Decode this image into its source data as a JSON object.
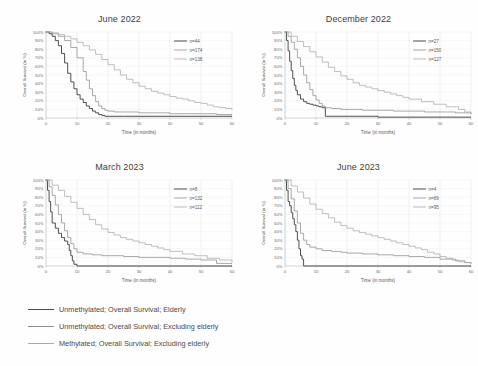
{
  "figure": {
    "background": "#ffffff",
    "series_colors": [
      "#4f4f4f",
      "#8e8e8e",
      "#a9a9a9"
    ]
  },
  "legend": {
    "entries": [
      {
        "label": "Unmethylated; Overall Survival; Elderly",
        "color": "#4f4f4f"
      },
      {
        "label": "Unmethylated; Overall Survival; Excluding elderly",
        "color": "#8e8e8e"
      },
      {
        "label": "Methylated; Overall Survival; Excluding elderly",
        "color": "#a9a9a9"
      }
    ]
  },
  "chart_data": [
    {
      "type": "line",
      "title": "June 2022",
      "xlabel": "Time (in months)",
      "ylabel": "Overall Survival (in %)",
      "xlim": [
        0,
        60
      ],
      "ylim": [
        0,
        100
      ],
      "xticks": [
        0,
        10,
        20,
        30,
        40,
        50,
        60
      ],
      "yticks": [
        0,
        10,
        20,
        30,
        40,
        50,
        60,
        70,
        80,
        90,
        100
      ],
      "ytick_labels": [
        "0%",
        "10%",
        "20%",
        "30%",
        "40%",
        "50%",
        "60%",
        "70%",
        "80%",
        "90%",
        "100%"
      ],
      "grid": true,
      "legend_position": "upper right",
      "series": [
        {
          "name": "n=44",
          "color": "#4f4f4f",
          "x": [
            0,
            1,
            2,
            3,
            4,
            5,
            6,
            7,
            8,
            9,
            10,
            11,
            12,
            13,
            14,
            15,
            16,
            17,
            18,
            19,
            20,
            25,
            30,
            40,
            50,
            60
          ],
          "y": [
            100,
            98,
            95,
            90,
            84,
            75,
            64,
            52,
            42,
            34,
            27,
            22,
            18,
            14,
            11,
            8,
            6,
            4,
            3,
            2,
            2,
            2,
            2,
            2,
            2,
            2
          ]
        },
        {
          "name": "n=174",
          "color": "#8e8e8e",
          "x": [
            0,
            2,
            4,
            6,
            8,
            10,
            12,
            13,
            14,
            15,
            16,
            17,
            18,
            19,
            20,
            22,
            25,
            30,
            35,
            40,
            45,
            50,
            55,
            60
          ],
          "y": [
            100,
            98,
            95,
            90,
            82,
            70,
            54,
            44,
            34,
            26,
            19,
            14,
            11,
            9,
            8,
            7,
            7,
            6,
            6,
            5,
            5,
            5,
            4,
            4
          ]
        },
        {
          "name": "n=138",
          "color": "#a9a9a9",
          "x": [
            0,
            2,
            4,
            6,
            8,
            10,
            12,
            14,
            16,
            18,
            20,
            22,
            24,
            26,
            28,
            30,
            32,
            34,
            36,
            38,
            40,
            42,
            44,
            46,
            48,
            50,
            52,
            54,
            56,
            58,
            60
          ],
          "y": [
            100,
            99,
            97,
            95,
            92,
            88,
            84,
            79,
            74,
            68,
            62,
            56,
            50,
            45,
            41,
            37,
            34,
            31,
            29,
            27,
            25,
            23,
            22,
            20,
            18,
            17,
            15,
            13,
            12,
            11,
            10
          ]
        }
      ]
    },
    {
      "type": "line",
      "title": "December 2022",
      "xlabel": "Time (in months)",
      "ylabel": "Overall Survival (in %)",
      "xlim": [
        0,
        60
      ],
      "ylim": [
        0,
        100
      ],
      "xticks": [
        0,
        10,
        20,
        30,
        40,
        50,
        60
      ],
      "yticks": [
        0,
        10,
        20,
        30,
        40,
        50,
        60,
        70,
        80,
        90,
        100
      ],
      "ytick_labels": [
        "0%",
        "10%",
        "20%",
        "30%",
        "40%",
        "50%",
        "60%",
        "70%",
        "80%",
        "90%",
        "100%"
      ],
      "grid": true,
      "legend_position": "upper right",
      "series": [
        {
          "name": "n=27",
          "color": "#4f4f4f",
          "x": [
            0,
            0.5,
            1,
            1.5,
            2,
            2.5,
            3,
            3.5,
            4,
            5,
            6,
            7,
            8,
            9,
            10,
            11,
            12,
            13,
            20,
            30,
            40,
            50,
            60
          ],
          "y": [
            100,
            90,
            78,
            66,
            55,
            46,
            38,
            32,
            27,
            22,
            19,
            17,
            16,
            15,
            14,
            13,
            12,
            2,
            2,
            1,
            1,
            1,
            1
          ]
        },
        {
          "name": "n=150",
          "color": "#8e8e8e",
          "x": [
            0,
            1,
            2,
            3,
            4,
            5,
            6,
            7,
            8,
            9,
            10,
            11,
            12,
            13,
            15,
            18,
            20,
            25,
            30,
            35,
            40,
            45,
            50,
            55,
            60
          ],
          "y": [
            100,
            95,
            88,
            80,
            70,
            60,
            50,
            41,
            33,
            26,
            21,
            17,
            14,
            12,
            11,
            10,
            10,
            9,
            9,
            8,
            8,
            7,
            7,
            6,
            5
          ]
        },
        {
          "name": "n=127",
          "color": "#a9a9a9",
          "x": [
            0,
            2,
            4,
            6,
            8,
            10,
            12,
            14,
            16,
            18,
            20,
            22,
            24,
            26,
            28,
            30,
            32,
            34,
            36,
            38,
            40,
            44,
            48,
            52,
            56,
            58,
            60
          ],
          "y": [
            100,
            95,
            89,
            83,
            77,
            71,
            65,
            59,
            54,
            49,
            45,
            41,
            38,
            36,
            34,
            32,
            30,
            28,
            26,
            24,
            22,
            19,
            16,
            13,
            10,
            7,
            5
          ]
        }
      ]
    },
    {
      "type": "line",
      "title": "March 2023",
      "xlabel": "Time (in months)",
      "ylabel": "Overall Survival (in %)",
      "xlim": [
        0,
        60
      ],
      "ylim": [
        0,
        100
      ],
      "xticks": [
        0,
        10,
        20,
        30,
        40,
        50,
        60
      ],
      "yticks": [
        0,
        10,
        20,
        30,
        40,
        50,
        60,
        70,
        80,
        90,
        100
      ],
      "ytick_labels": [
        "0%",
        "10%",
        "20%",
        "30%",
        "40%",
        "50%",
        "60%",
        "70%",
        "80%",
        "90%",
        "100%"
      ],
      "grid": true,
      "legend_position": "upper right",
      "series": [
        {
          "name": "n=8",
          "color": "#4f4f4f",
          "x": [
            0,
            0.5,
            1,
            1.5,
            2,
            3,
            4,
            5,
            6,
            7,
            7.5,
            8,
            8.5,
            9,
            10,
            20,
            30,
            40,
            50,
            60
          ],
          "y": [
            100,
            88,
            75,
            63,
            50,
            44,
            38,
            33,
            29,
            25,
            18,
            12,
            6,
            2,
            0,
            0,
            0,
            0,
            0,
            0
          ]
        },
        {
          "name": "n=132",
          "color": "#8e8e8e",
          "x": [
            0,
            1,
            2,
            3,
            4,
            5,
            6,
            7,
            8,
            9,
            10,
            12,
            15,
            18,
            20,
            25,
            30,
            35,
            40,
            45,
            50,
            53,
            55,
            58,
            60
          ],
          "y": [
            100,
            92,
            82,
            71,
            60,
            50,
            41,
            33,
            26,
            20,
            16,
            14,
            13,
            12,
            12,
            11,
            10,
            10,
            9,
            8,
            7,
            7,
            3,
            3,
            3
          ]
        },
        {
          "name": "n=112",
          "color": "#a9a9a9",
          "x": [
            0,
            2,
            4,
            6,
            8,
            10,
            12,
            14,
            16,
            18,
            20,
            22,
            24,
            26,
            28,
            30,
            32,
            34,
            36,
            38,
            40,
            44,
            48,
            52,
            56,
            60
          ],
          "y": [
            100,
            94,
            88,
            81,
            74,
            67,
            60,
            54,
            48,
            43,
            39,
            36,
            33,
            31,
            29,
            27,
            25,
            23,
            21,
            19,
            17,
            14,
            12,
            9,
            7,
            5
          ]
        }
      ]
    },
    {
      "type": "line",
      "title": "June 2023",
      "xlabel": "Time (in months)",
      "ylabel": "Overall Survival (in %)",
      "xlim": [
        0,
        60
      ],
      "ylim": [
        0,
        100
      ],
      "xticks": [
        0,
        10,
        20,
        30,
        40,
        50,
        60
      ],
      "yticks": [
        0,
        10,
        20,
        30,
        40,
        50,
        60,
        70,
        80,
        90,
        100
      ],
      "ytick_labels": [
        "0%",
        "10%",
        "20%",
        "30%",
        "40%",
        "50%",
        "60%",
        "70%",
        "80%",
        "90%",
        "100%"
      ],
      "grid": true,
      "legend_position": "upper right",
      "series": [
        {
          "name": "n=4",
          "color": "#4f4f4f",
          "x": [
            0,
            0.5,
            1,
            1.5,
            2,
            2.5,
            3,
            3.5,
            4,
            4.5,
            5,
            5.5,
            6,
            10,
            20,
            30,
            40,
            50,
            60
          ],
          "y": [
            100,
            88,
            75,
            70,
            62,
            55,
            48,
            40,
            30,
            20,
            12,
            8,
            0,
            0,
            0,
            0,
            0,
            0,
            0
          ]
        },
        {
          "name": "n=89",
          "color": "#8e8e8e",
          "x": [
            0,
            1,
            2,
            3,
            4,
            5,
            6,
            7,
            8,
            10,
            12,
            15,
            18,
            20,
            25,
            30,
            35,
            40,
            45,
            50,
            55,
            58,
            60
          ],
          "y": [
            100,
            90,
            78,
            64,
            50,
            38,
            30,
            25,
            22,
            20,
            18,
            17,
            16,
            15,
            14,
            13,
            12,
            11,
            10,
            8,
            6,
            4,
            3
          ]
        },
        {
          "name": "n=95",
          "color": "#a9a9a9",
          "x": [
            0,
            2,
            4,
            6,
            8,
            10,
            12,
            14,
            16,
            18,
            20,
            22,
            24,
            26,
            28,
            30,
            32,
            34,
            36,
            38,
            40,
            42,
            44,
            46,
            48,
            50,
            52,
            54,
            56,
            58,
            60
          ],
          "y": [
            100,
            93,
            86,
            79,
            72,
            66,
            61,
            56,
            51,
            47,
            44,
            41,
            39,
            37,
            35,
            33,
            31,
            29,
            27,
            25,
            23,
            21,
            19,
            16,
            14,
            11,
            9,
            7,
            5,
            4,
            3
          ]
        }
      ]
    }
  ]
}
